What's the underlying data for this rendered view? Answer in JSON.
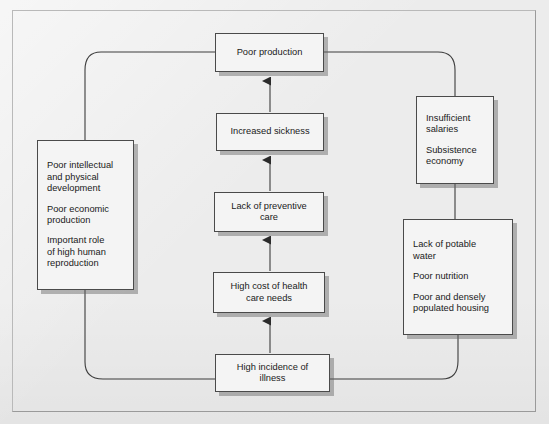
{
  "diagram": {
    "background_color": "#ececec",
    "node_fill": "#f4f4f4",
    "node_border": "#4a4a4a",
    "connector_color": "#3c3c3c",
    "nodes": {
      "poor_production": {
        "label": "Poor production"
      },
      "increased_sickness": {
        "label": "Increased sickness"
      },
      "lack_preventive_care": {
        "line1": "Lack of preventive",
        "line2": "care"
      },
      "high_cost_health_care": {
        "line1": "High cost of health",
        "line2": "care needs"
      },
      "high_incidence_illness": {
        "line1": "High incidence of",
        "line2": "illness"
      },
      "poor_intellectual": {
        "para1_line1": "Poor intellectual",
        "para1_line2": "and physical",
        "para1_line3": "development",
        "para2_line1": "Poor economic",
        "para2_line2": "production",
        "para3_line1": "Important role",
        "para3_line2": "of high human",
        "para3_line3": "reproduction"
      },
      "insufficient_salaries": {
        "para1_line1": "Insufficient",
        "para1_line2": "salaries",
        "para2_line1": "Subsistence",
        "para2_line2": "economy"
      },
      "lack_potable_water": {
        "para1_line1": "Lack of potable",
        "para1_line2": "water",
        "para2_line1": "Poor nutrition",
        "para3_line1": "Poor and densely",
        "para3_line2": "populated housing"
      }
    },
    "connectors": [
      {
        "name": "illness-to-high-cost",
        "type": "arrow",
        "from": "high_incidence_illness",
        "to": "high_cost_health_care"
      },
      {
        "name": "high-cost-to-preventive",
        "type": "arrow",
        "from": "high_cost_health_care",
        "to": "lack_preventive_care"
      },
      {
        "name": "preventive-to-sickness",
        "type": "arrow",
        "from": "lack_preventive_care",
        "to": "increased_sickness"
      },
      {
        "name": "sickness-to-production",
        "type": "arrow",
        "from": "increased_sickness",
        "to": "poor_production"
      },
      {
        "name": "salaries-to-potable-water",
        "type": "arrow",
        "from": "insufficient_salaries",
        "to": "lack_potable_water"
      },
      {
        "name": "production-to-intellectual",
        "type": "curve",
        "from": "poor_production",
        "to": "poor_intellectual"
      },
      {
        "name": "intellectual-to-illness",
        "type": "curve",
        "from": "poor_intellectual",
        "to": "high_incidence_illness"
      },
      {
        "name": "production-to-salaries",
        "type": "curve",
        "from": "poor_production",
        "to": "insufficient_salaries"
      },
      {
        "name": "illness-to-potable-water",
        "type": "curve",
        "from": "high_incidence_illness",
        "to": "lack_potable_water"
      }
    ]
  }
}
